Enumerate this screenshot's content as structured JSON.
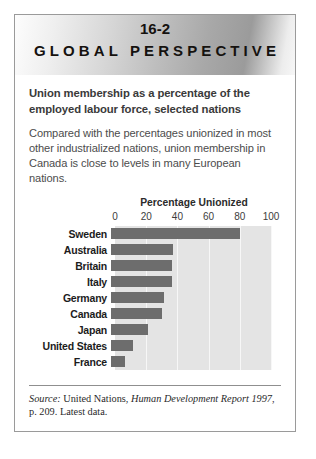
{
  "card": {
    "banner": {
      "number": "16-2",
      "title": "GLOBAL PERSPECTIVE"
    },
    "headline": "Union membership as a percentage of the employed labour force, selected nations",
    "intro": "Compared with the percentages unionized in most other industrialized nations, union membership in Canada is close to levels in many European nations.",
    "source": {
      "label": "Source:",
      "text_before": " United Nations, ",
      "italic": "Human Development Report 1997",
      "text_after": ", p. 209. Latest data."
    }
  },
  "chart_data": {
    "type": "bar",
    "orientation": "horizontal",
    "title": "Percentage Unionized",
    "xlabel": "Percentage Unionized",
    "ylabel": "",
    "xlim": [
      0,
      100
    ],
    "ticks": [
      0,
      20,
      40,
      60,
      80,
      100
    ],
    "grid": true,
    "legend": "none",
    "categories": [
      "Sweden",
      "Australia",
      "Britain",
      "Italy",
      "Germany",
      "Canada",
      "Japan",
      "United States",
      "France"
    ],
    "values": [
      83,
      40,
      39,
      39,
      34,
      33,
      24,
      14,
      9
    ],
    "colors": {
      "bar": "#6d6d6d",
      "plot_background": "#e4e4e4",
      "gridline": "#f7f7f7"
    }
  }
}
